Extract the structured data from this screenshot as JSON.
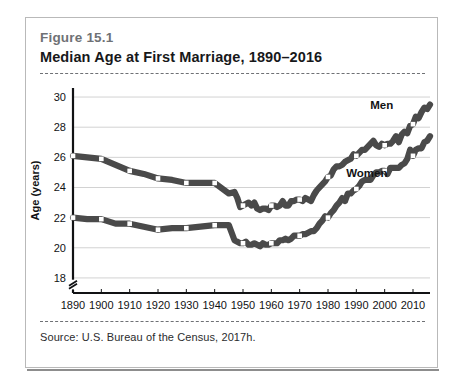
{
  "figure": {
    "number": "Figure 15.1",
    "title": "Median Age at First Marriage, 1890–2016",
    "source": "Source: U.S. Bureau of the Census, 2017h."
  },
  "colors": {
    "line": "#4a4a4a",
    "marker_fill": "#ffffff",
    "grid": "#d2d2d2",
    "axis": "#111214",
    "card_border": "#b9b9b9",
    "figure_number_text": "#6f7175",
    "title_text": "#17181a"
  },
  "chart_data": {
    "type": "line",
    "title": "Median Age at First Marriage, 1890–2016",
    "xlabel": "",
    "ylabel": "Age (years)",
    "xlim": [
      1890,
      2016
    ],
    "ylim": [
      17,
      30.6
    ],
    "y_axis_break": true,
    "grid": true,
    "legend": "inline-labels",
    "yticks": [
      18,
      20,
      22,
      24,
      26,
      28,
      30
    ],
    "xticks": [
      1890,
      1900,
      1910,
      1920,
      1930,
      1940,
      1950,
      1960,
      1970,
      1980,
      1990,
      2000,
      2010
    ],
    "marker_years": [
      1890,
      1900,
      1910,
      1920,
      1930,
      1940,
      1950,
      1960,
      1970,
      1980,
      1990,
      2000,
      2010
    ],
    "series": [
      {
        "name": "Men",
        "label": "Men",
        "label_year": 2003,
        "label_value": 29.2,
        "x": [
          1890,
          1895,
          1900,
          1905,
          1910,
          1915,
          1920,
          1925,
          1930,
          1935,
          1940,
          1945,
          1947,
          1948,
          1949,
          1950,
          1951,
          1952,
          1953,
          1954,
          1955,
          1956,
          1957,
          1958,
          1959,
          1960,
          1961,
          1962,
          1963,
          1964,
          1965,
          1966,
          1967,
          1968,
          1969,
          1970,
          1971,
          1972,
          1973,
          1974,
          1975,
          1976,
          1977,
          1978,
          1979,
          1980,
          1981,
          1982,
          1983,
          1984,
          1985,
          1986,
          1987,
          1988,
          1989,
          1990,
          1991,
          1992,
          1993,
          1994,
          1995,
          1996,
          1997,
          1998,
          1999,
          2000,
          2001,
          2002,
          2003,
          2004,
          2005,
          2006,
          2007,
          2008,
          2009,
          2010,
          2011,
          2012,
          2013,
          2014,
          2015,
          2016
        ],
        "y": [
          26.1,
          26.0,
          25.9,
          25.5,
          25.1,
          24.9,
          24.6,
          24.5,
          24.3,
          24.3,
          24.3,
          23.6,
          23.7,
          23.3,
          22.7,
          22.8,
          22.9,
          23.0,
          22.8,
          23.0,
          22.6,
          22.5,
          22.6,
          22.6,
          22.5,
          22.8,
          22.8,
          22.7,
          22.8,
          23.1,
          22.8,
          22.8,
          23.1,
          23.1,
          23.2,
          23.2,
          23.1,
          23.3,
          23.2,
          23.1,
          23.5,
          23.8,
          24.0,
          24.2,
          24.4,
          24.7,
          24.8,
          25.2,
          25.4,
          25.4,
          25.5,
          25.7,
          25.8,
          25.9,
          26.2,
          26.1,
          26.3,
          26.5,
          26.5,
          26.7,
          26.9,
          27.1,
          26.8,
          26.7,
          26.9,
          26.8,
          26.9,
          26.9,
          27.1,
          27.4,
          27.0,
          27.5,
          27.7,
          27.6,
          28.1,
          28.2,
          28.7,
          28.6,
          29.0,
          29.3,
          29.2,
          29.5
        ],
        "endpoints": {
          "start": {
            "year": 1890,
            "value": 26.1
          },
          "end": {
            "year": 2016,
            "value": 29.5
          }
        },
        "minimum": {
          "year": 1956,
          "value": 22.5
        }
      },
      {
        "name": "Women",
        "label": "Women",
        "label_year": 2001,
        "label_value": 24.7,
        "x": [
          1890,
          1895,
          1900,
          1905,
          1910,
          1915,
          1920,
          1925,
          1930,
          1935,
          1940,
          1945,
          1947,
          1948,
          1949,
          1950,
          1951,
          1952,
          1953,
          1954,
          1955,
          1956,
          1957,
          1958,
          1959,
          1960,
          1961,
          1962,
          1963,
          1964,
          1965,
          1966,
          1967,
          1968,
          1969,
          1970,
          1971,
          1972,
          1973,
          1974,
          1975,
          1976,
          1977,
          1978,
          1979,
          1980,
          1981,
          1982,
          1983,
          1984,
          1985,
          1986,
          1987,
          1988,
          1989,
          1990,
          1991,
          1992,
          1993,
          1994,
          1995,
          1996,
          1997,
          1998,
          1999,
          2000,
          2001,
          2002,
          2003,
          2004,
          2005,
          2006,
          2007,
          2008,
          2009,
          2010,
          2011,
          2012,
          2013,
          2014,
          2015,
          2016
        ],
        "y": [
          22.0,
          21.9,
          21.9,
          21.6,
          21.6,
          21.4,
          21.2,
          21.3,
          21.3,
          21.4,
          21.5,
          21.5,
          20.5,
          20.4,
          20.3,
          20.3,
          20.4,
          20.2,
          20.2,
          20.3,
          20.2,
          20.1,
          20.3,
          20.2,
          20.2,
          20.3,
          20.3,
          20.3,
          20.5,
          20.5,
          20.6,
          20.5,
          20.6,
          20.8,
          20.8,
          20.8,
          20.9,
          20.9,
          21.0,
          21.1,
          21.1,
          21.3,
          21.6,
          21.8,
          22.1,
          22.0,
          22.3,
          22.5,
          22.8,
          23.0,
          23.3,
          23.1,
          23.6,
          23.6,
          23.8,
          23.9,
          24.1,
          24.4,
          24.5,
          24.5,
          24.5,
          24.8,
          25.0,
          25.0,
          25.1,
          25.1,
          24.9,
          25.3,
          25.3,
          25.3,
          25.3,
          25.5,
          25.6,
          25.9,
          26.5,
          26.1,
          26.5,
          26.6,
          26.6,
          27.0,
          27.1,
          27.4
        ],
        "endpoints": {
          "start": {
            "year": 1890,
            "value": 22.0
          },
          "end": {
            "year": 2016,
            "value": 27.4
          }
        },
        "minimum": {
          "year": 1956,
          "value": 20.1
        }
      }
    ]
  }
}
